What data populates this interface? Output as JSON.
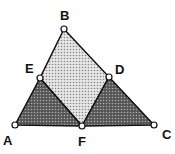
{
  "diagram": {
    "points": {
      "A": {
        "label": "A",
        "x": 15,
        "y": 125
      },
      "B": {
        "label": "B",
        "x": 64,
        "y": 29
      },
      "C": {
        "label": "C",
        "x": 154,
        "y": 125
      },
      "D": {
        "label": "D",
        "x": 109,
        "y": 77
      },
      "E": {
        "label": "E",
        "x": 40,
        "y": 78
      },
      "F": {
        "label": "F",
        "x": 82,
        "y": 126
      }
    },
    "regions": [
      {
        "name": "parallelogram-BEFD",
        "shade": "light-dotted"
      },
      {
        "name": "triangle-AEF",
        "shade": "dark-dotted"
      },
      {
        "name": "triangle-FDC",
        "shade": "dark-dotted"
      }
    ],
    "colors": {
      "light_fill": "#cfcfcf",
      "dark_fill": "#7a7a7a",
      "stroke": "#111111"
    }
  }
}
